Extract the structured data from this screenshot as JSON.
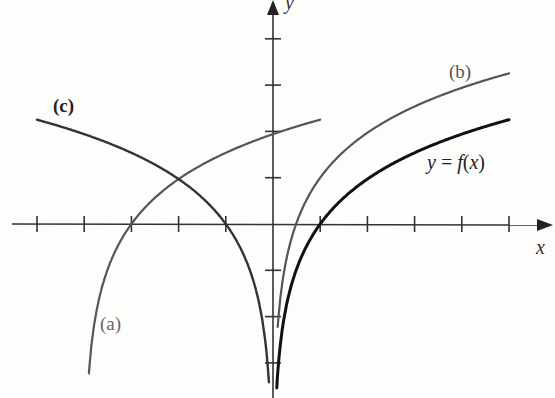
{
  "chart_data": {
    "type": "line",
    "title": "",
    "xlabel": "x",
    "ylabel": "y",
    "grid": false,
    "axis_ticks": {
      "x": [
        -5,
        -4,
        -3,
        -2,
        -1,
        1,
        2,
        3,
        4,
        5
      ],
      "y": [
        -3,
        -2,
        -1,
        1,
        2,
        3,
        4
      ]
    },
    "xlim": [
      -5.5,
      5.8
    ],
    "ylim": [
      -3.7,
      4.8
    ],
    "tick_labels_shown": false,
    "series": [
      {
        "name": "y = f(x)",
        "label": "y = f(x)",
        "description": "logarithmic curve, x-intercept at 1, vertical asymptote x=0",
        "domain": [
          0.03,
          5
        ],
        "x_intercept": 1,
        "end_point": [
          5,
          2.2
        ],
        "color": "#111111",
        "stroke": "heavy"
      },
      {
        "name": "(a)",
        "label": "(a)",
        "description": "f shifted left 4 units: f(x+4)",
        "domain": [
          -3.9,
          1
        ],
        "x_intercept": -3,
        "y_intercept": 1.9,
        "color": "#555555"
      },
      {
        "name": "(b)",
        "label": "(b)",
        "description": "f shifted up 1 unit: f(x)+1",
        "domain": [
          0.1,
          5
        ],
        "x_intercept": 0.5,
        "end_point": [
          5,
          3.2
        ],
        "color": "#555555"
      },
      {
        "name": "(c)",
        "label": "(c)",
        "description": "f reflected in y-axis: f(-x)",
        "domain": [
          -5,
          -0.05
        ],
        "x_intercept": -1,
        "start_point": [
          -5,
          2.2
        ],
        "color": "#333333"
      }
    ],
    "annotations": [
      "(a)",
      "(b)",
      "(c)",
      "y = f(x)"
    ]
  },
  "labels": {
    "x_axis": "x",
    "y_axis": "y",
    "curve_a": "(a)",
    "curve_b": "(b)",
    "curve_c": "(c)",
    "curve_f_y": "y",
    "curve_f_eq": " = ",
    "curve_f_f": "f",
    "curve_f_open": "(",
    "curve_f_x": "x",
    "curve_f_close": ")"
  }
}
